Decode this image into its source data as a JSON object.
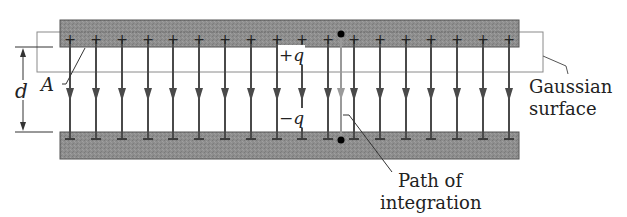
{
  "diagram": {
    "labels": {
      "d": "d",
      "area": "A",
      "plus_q": "+q",
      "minus_q": "−q",
      "gaussian_line1": "Gaussian",
      "gaussian_line2": "surface",
      "path_line1": "Path of",
      "path_line2": "integration"
    },
    "plates": {
      "top": {
        "charge_symbol": "+",
        "count": 19
      },
      "bottom": {
        "charge_symbol": "−",
        "count": 19
      }
    },
    "field_lines": {
      "count": 19,
      "direction": "down",
      "x_positions": [
        70,
        96,
        122,
        148,
        173,
        199,
        225,
        251,
        277,
        302,
        328,
        354,
        380,
        406,
        431,
        457,
        483,
        509
      ],
      "path_line_x": 341
    },
    "colors": {
      "plate_fill": "#8c8c8c",
      "plate_edge": "#555555",
      "field_line": "#4a4a4a",
      "path_line": "#9a9a9a",
      "gaussian_outline": "#888888",
      "text": "#222222"
    }
  }
}
